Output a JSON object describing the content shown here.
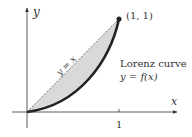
{
  "diagram": {
    "axes": {
      "x_label": "x",
      "y_label": "y",
      "x_tick_label": "1"
    },
    "point_label": "(1, 1)",
    "line_label": "y = x",
    "curve_label_line1": "Lorenz curve",
    "curve_label_line2": "y = f(x)",
    "colors": {
      "curve": "#222222",
      "fill": "#d9d9d9",
      "axis": "#333333",
      "dashed_line": "#555555"
    }
  }
}
